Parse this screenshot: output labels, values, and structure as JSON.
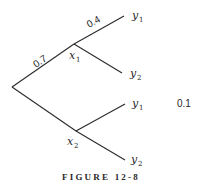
{
  "diagram": {
    "type": "probability-tree",
    "caption": "FIGURE 12-8",
    "nodes": {
      "root": {
        "label": ""
      },
      "x1": {
        "base": "x",
        "sub": "1"
      },
      "x2": {
        "base": "x",
        "sub": "2"
      },
      "x1_y1": {
        "base": "y",
        "sub": "1"
      },
      "x1_y2": {
        "base": "y",
        "sub": "2"
      },
      "x2_y1": {
        "base": "y",
        "sub": "1"
      },
      "x2_y2": {
        "base": "y",
        "sub": "2"
      }
    },
    "edge_labels": {
      "root_x1": "0.7",
      "x1_y1": "0.4",
      "x2_y1": "0.1"
    }
  }
}
